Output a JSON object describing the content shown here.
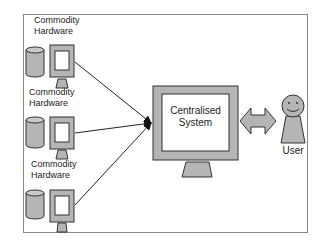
{
  "diagram": {
    "type": "architecture",
    "nodes": [
      {
        "id": "hw1",
        "label_line1": "Commodity",
        "label_line2": "Hardware"
      },
      {
        "id": "hw2",
        "label_line1": "Commodity",
        "label_line2": "Hardware"
      },
      {
        "id": "hw3",
        "label_line1": "Commodity",
        "label_line2": "Hardware"
      },
      {
        "id": "central",
        "label_line1": "Centralised",
        "label_line2": "System"
      },
      {
        "id": "user",
        "label": "User"
      }
    ],
    "edges": [
      {
        "from": "hw1",
        "to": "central",
        "style": "arrow"
      },
      {
        "from": "hw2",
        "to": "central",
        "style": "arrow"
      },
      {
        "from": "hw3",
        "to": "central",
        "style": "arrow"
      },
      {
        "from": "central",
        "to": "user",
        "style": "double-arrow"
      }
    ]
  },
  "colors": {
    "fill_gray": "#b5b5b5",
    "stroke": "#333333",
    "frame": "#777777"
  }
}
